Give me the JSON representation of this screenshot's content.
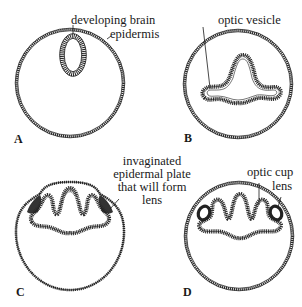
{
  "figure": {
    "panels": [
      {
        "letter": "A",
        "labels": {
          "developing_brain": "developing brain",
          "epidermis": "epidermis"
        }
      },
      {
        "letter": "B",
        "labels": {
          "optic_vesicle": "optic vesicle"
        }
      },
      {
        "letter": "C",
        "labels": {
          "invaginated_plate_line1": "invaginated",
          "invaginated_plate_line2": "epidermal plate",
          "invaginated_plate_line3": "that will form",
          "invaginated_plate_line4": "lens"
        }
      },
      {
        "letter": "D",
        "labels": {
          "optic_cup": "optic cup",
          "lens": "lens"
        }
      }
    ],
    "colors": {
      "ink": "#1a1a1a",
      "tissue_fill": "#d8d8d8",
      "dark_tissue": "#3a3a3a",
      "background": "#ffffff"
    }
  }
}
